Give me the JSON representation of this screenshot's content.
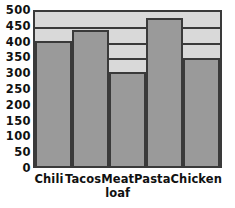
{
  "chart_data": {
    "type": "bar",
    "title": "",
    "xlabel": "",
    "ylabel": "",
    "categories": [
      "Chili",
      "Tacos",
      "Meat loaf",
      "Pasta",
      "Chicken"
    ],
    "values": [
      400,
      435,
      300,
      475,
      345
    ],
    "ylim": [
      0,
      500
    ],
    "ytick_labels": [
      "500",
      "450",
      "400",
      "350",
      "300",
      "250",
      "200",
      "150",
      "100",
      "50",
      "0"
    ],
    "ytick_values": [
      500,
      450,
      400,
      350,
      300,
      250,
      200,
      150,
      100,
      50,
      0
    ],
    "ytick_step": 50,
    "grid": true,
    "grid_orientation": "horizontal",
    "legend": false,
    "legend_position": "none",
    "bar_color": "#9a9a9a",
    "bar_edge_color": "#3a3a3a",
    "plot_background_color": "#d9d9d9",
    "axis_color": "#3a3a3a",
    "text_color": "#111111",
    "category_label_lines": [
      [
        "Chili"
      ],
      [
        "Tacos"
      ],
      [
        "Meat",
        "loaf"
      ],
      [
        "Pasta"
      ],
      [
        "Chicken"
      ]
    ]
  }
}
